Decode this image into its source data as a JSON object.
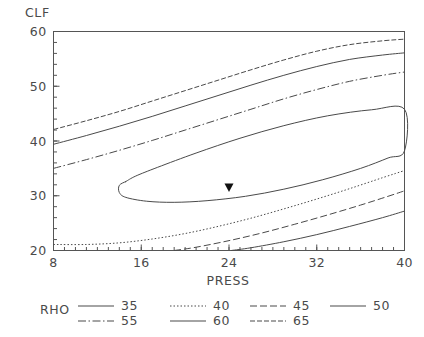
{
  "chart_data": {
    "type": "line",
    "title": "",
    "subtitle": "",
    "xlabel": "PRESS",
    "ylabel": "CLF",
    "xlim": [
      8,
      40
    ],
    "ylim": [
      20,
      60
    ],
    "xticks": [
      "8",
      "16",
      "24",
      "32",
      "40"
    ],
    "xtick_values": [
      8,
      16,
      24,
      32,
      40
    ],
    "yticks": [
      "20",
      "30",
      "40",
      "50",
      "60"
    ],
    "ytick_values": [
      20,
      30,
      40,
      50,
      60
    ],
    "grid": false,
    "legend_position": "bottom",
    "legend_title": "RHO",
    "minor_tick_step_x": 1,
    "minor_tick_step_y": 2,
    "annotation_marker": {
      "name": "cursor-marker",
      "shape": "down-triangle",
      "x": 24.0,
      "y": 31.5
    },
    "series": [
      {
        "name": "35",
        "level": 35,
        "style": "solid",
        "dash": "none",
        "closed": true,
        "points": [
          [
            14.6,
            32.6
          ],
          [
            14.0,
            31.9
          ],
          [
            14.0,
            30.6
          ],
          [
            14.6,
            29.7
          ],
          [
            16.5,
            29.0
          ],
          [
            19.0,
            28.8
          ],
          [
            22.0,
            29.1
          ],
          [
            25.5,
            29.9
          ],
          [
            29.0,
            31.2
          ],
          [
            32.5,
            32.9
          ],
          [
            36.0,
            35.0
          ],
          [
            38.5,
            36.9
          ],
          [
            40.0,
            38.2
          ],
          [
            40.0,
            45.8
          ],
          [
            37.0,
            45.7
          ],
          [
            33.0,
            44.6
          ],
          [
            29.0,
            42.8
          ],
          [
            25.0,
            40.5
          ],
          [
            21.0,
            37.8
          ],
          [
            17.5,
            35.2
          ],
          [
            15.5,
            33.6
          ],
          [
            14.6,
            32.6
          ]
        ]
      },
      {
        "name": "40",
        "level": 40,
        "style": "dotted",
        "dash": "1.5,2",
        "closed": false,
        "points": [
          [
            8.0,
            21.1
          ],
          [
            11.0,
            21.1
          ],
          [
            14.0,
            21.4
          ],
          [
            17.0,
            22.1
          ],
          [
            20.0,
            23.1
          ],
          [
            23.0,
            24.4
          ],
          [
            26.0,
            25.9
          ],
          [
            29.0,
            27.6
          ],
          [
            32.0,
            29.4
          ],
          [
            35.0,
            31.3
          ],
          [
            38.0,
            33.3
          ],
          [
            40.0,
            34.6
          ]
        ]
      },
      {
        "name": "45",
        "level": 45,
        "style": "long-dash",
        "dash": "7,3",
        "closed": false,
        "points": [
          [
            19.0,
            20.0
          ],
          [
            21.0,
            20.6
          ],
          [
            24.0,
            21.8
          ],
          [
            27.0,
            23.2
          ],
          [
            30.0,
            24.8
          ],
          [
            33.0,
            26.5
          ],
          [
            36.0,
            28.3
          ],
          [
            38.5,
            29.9
          ],
          [
            40.0,
            30.9
          ]
        ]
      },
      {
        "name": "50",
        "level": 50,
        "style": "solid",
        "dash": "none",
        "closed": false,
        "points": [
          [
            24.2,
            20.0
          ],
          [
            26.0,
            20.5
          ],
          [
            29.0,
            21.6
          ],
          [
            32.0,
            22.9
          ],
          [
            35.0,
            24.4
          ],
          [
            38.0,
            26.0
          ],
          [
            40.0,
            27.2
          ]
        ]
      },
      {
        "name": "55",
        "level": 55,
        "style": "dash-dot",
        "dash": "8,2.5,1.5,2.5",
        "closed": false,
        "points": [
          [
            8.0,
            35.0
          ],
          [
            11.0,
            36.6
          ],
          [
            14.0,
            38.3
          ],
          [
            17.0,
            40.1
          ],
          [
            20.0,
            42.0
          ],
          [
            23.0,
            43.9
          ],
          [
            26.0,
            45.8
          ],
          [
            29.0,
            47.7
          ],
          [
            32.0,
            49.4
          ],
          [
            35.0,
            50.9
          ],
          [
            38.0,
            52.0
          ],
          [
            40.0,
            52.6
          ]
        ]
      },
      {
        "name": "60",
        "level": 60,
        "style": "solid",
        "dash": "none",
        "closed": false,
        "points": [
          [
            8.0,
            39.4
          ],
          [
            11.0,
            41.0
          ],
          [
            14.0,
            42.7
          ],
          [
            17.0,
            44.5
          ],
          [
            20.0,
            46.4
          ],
          [
            23.0,
            48.3
          ],
          [
            26.0,
            50.2
          ],
          [
            29.0,
            52.0
          ],
          [
            32.0,
            53.6
          ],
          [
            35.0,
            54.9
          ],
          [
            38.0,
            55.7
          ],
          [
            40.0,
            56.1
          ]
        ]
      },
      {
        "name": "65",
        "level": 65,
        "style": "medium-dash",
        "dash": "5,2",
        "closed": false,
        "points": [
          [
            8.0,
            42.1
          ],
          [
            11.0,
            43.7
          ],
          [
            14.0,
            45.4
          ],
          [
            17.0,
            47.3
          ],
          [
            20.0,
            49.2
          ],
          [
            23.0,
            51.1
          ],
          [
            26.0,
            53.0
          ],
          [
            29.0,
            54.8
          ],
          [
            32.0,
            56.4
          ],
          [
            35.0,
            57.6
          ],
          [
            38.0,
            58.3
          ],
          [
            40.0,
            58.6
          ]
        ]
      }
    ]
  },
  "axes": {
    "y_axis_title": "CLF",
    "x_axis_title": "PRESS"
  },
  "legend": {
    "title": "RHO",
    "entries": [
      {
        "label": "35",
        "style": "solid",
        "dash": "none"
      },
      {
        "label": "40",
        "style": "dotted",
        "dash": "1.5,2"
      },
      {
        "label": "45",
        "style": "long-dash",
        "dash": "7,3"
      },
      {
        "label": "50",
        "style": "solid",
        "dash": "none"
      },
      {
        "label": "55",
        "style": "dash-dot",
        "dash": "8,2.5,1.5,2.5"
      },
      {
        "label": "60",
        "style": "solid",
        "dash": "none"
      },
      {
        "label": "65",
        "style": "medium-dash",
        "dash": "5,2"
      }
    ]
  },
  "colors": {
    "line": "#4a4a4a",
    "frame": "#555555",
    "text": "#4a4a4a",
    "background": "#ffffff",
    "marker": "#111111"
  }
}
